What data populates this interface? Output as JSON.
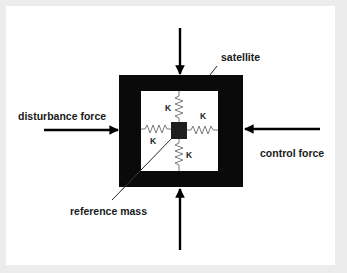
{
  "diagram": {
    "labels": {
      "satellite": "satellite",
      "disturbance_force": "disturbance force",
      "control_force": "control force",
      "reference_mass": "reference mass"
    },
    "springs": [
      {
        "position": "top",
        "label": "K"
      },
      {
        "position": "right",
        "label": "K"
      },
      {
        "position": "left",
        "label": "K"
      },
      {
        "position": "bottom",
        "label": "K"
      }
    ],
    "colors": {
      "frame": "#0a0a0a",
      "mass": "#1e1e1e",
      "spring": "#7a7a7a",
      "arrow": "#000000",
      "background": "#ffffff",
      "border": "#ececec"
    }
  }
}
